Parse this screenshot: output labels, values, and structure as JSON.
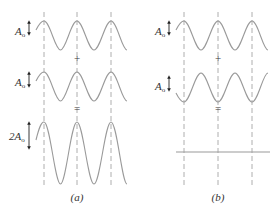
{
  "panels": [
    {
      "id": "a",
      "caption": "(a)",
      "description": "Constructive interference",
      "rows": [
        {
          "label": "A",
          "sub": "o",
          "amplitude_text": "A_o",
          "phase": "in phase"
        },
        {
          "label": "A",
          "sub": "o",
          "amplitude_text": "A_o",
          "phase": "in phase"
        },
        {
          "label": "2A",
          "sub": "o",
          "amplitude_text": "2A_o",
          "phase": "sum"
        }
      ],
      "operators": [
        "+",
        "="
      ]
    },
    {
      "id": "b",
      "caption": "(b)",
      "description": "Destructive interference",
      "rows": [
        {
          "label": "A",
          "sub": "o",
          "amplitude_text": "A_o",
          "phase": "0"
        },
        {
          "label": "A",
          "sub": "o",
          "amplitude_text": "A_o",
          "phase": "180 degrees out of phase"
        },
        {
          "label": "",
          "sub": "",
          "amplitude_text": "",
          "phase": "zero (flat line)"
        }
      ],
      "operators": [
        "+",
        "="
      ]
    }
  ],
  "colors": {
    "wave": "#9a9a9a",
    "text": "#333333",
    "arrow": "#222222"
  }
}
